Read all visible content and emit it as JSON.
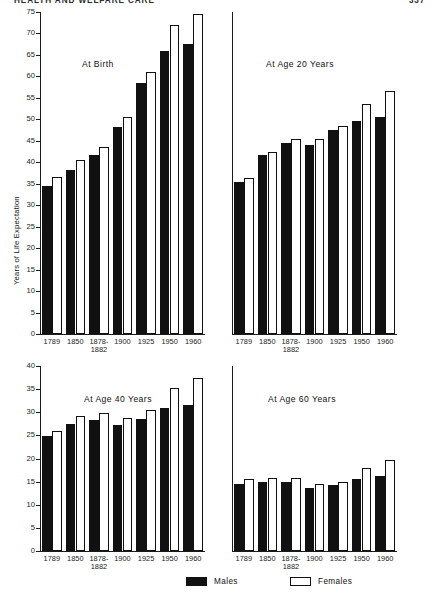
{
  "running_head": {
    "title": "HEALTH AND WELFARE CARE",
    "page_number": "337"
  },
  "figure": {
    "y_axis_caption": "Years of Life Expectation",
    "legend": [
      {
        "key": "males",
        "label": "Males",
        "style": "filled-black"
      },
      {
        "key": "females",
        "label": "Females",
        "style": "open-white"
      }
    ],
    "legend_colors": {
      "males": "#111111",
      "females": "#ffffff",
      "outline": "#111111"
    }
  },
  "chart_data": [
    {
      "type": "bar",
      "title": "At Birth",
      "panel": "top-left",
      "xlabel": "",
      "ylabel": "Years of Life Expectation",
      "categories": [
        "1789",
        "1850",
        "1878-1882",
        "1900",
        "1925",
        "1950",
        "1960"
      ],
      "category_lines": [
        [
          "1789"
        ],
        [
          "1850"
        ],
        [
          "1878-",
          "1882"
        ],
        [
          "1900"
        ],
        [
          "1925"
        ],
        [
          "1950"
        ],
        [
          "1960"
        ]
      ],
      "series": [
        {
          "name": "Males",
          "values": [
            34.5,
            38.3,
            41.7,
            48.2,
            58.5,
            66.0,
            67.5
          ]
        },
        {
          "name": "Females",
          "values": [
            36.5,
            40.5,
            43.5,
            50.5,
            61.0,
            72.0,
            74.5
          ]
        }
      ],
      "ylim": [
        0,
        75
      ],
      "yticks": [
        0,
        5,
        10,
        15,
        20,
        25,
        30,
        35,
        40,
        45,
        50,
        55,
        60,
        65,
        70,
        75
      ],
      "ytick_labels": [
        "0",
        "5",
        "10",
        "15",
        "20",
        "25",
        "30",
        "35",
        "40",
        "45",
        "50",
        "55",
        "60",
        "65",
        "70",
        "75"
      ],
      "grid": false,
      "legend_position": "below-figure"
    },
    {
      "type": "bar",
      "title": "At Age 20 Years",
      "panel": "top-right",
      "xlabel": "",
      "ylabel": "",
      "categories": [
        "1789",
        "1850",
        "1878-1882",
        "1900",
        "1925",
        "1950",
        "1960"
      ],
      "category_lines": [
        [
          "1789"
        ],
        [
          "1850"
        ],
        [
          "1878-",
          "1882"
        ],
        [
          "1900"
        ],
        [
          "1925"
        ],
        [
          "1950"
        ],
        [
          "1960"
        ]
      ],
      "series": [
        {
          "name": "Males",
          "values": [
            35.3,
            41.8,
            44.5,
            44.0,
            47.5,
            49.5,
            50.5
          ]
        },
        {
          "name": "Females",
          "values": [
            36.3,
            42.5,
            45.5,
            45.5,
            48.5,
            53.5,
            56.5
          ]
        }
      ],
      "ylim": [
        0,
        75
      ],
      "yticks": [],
      "ytick_labels": [],
      "grid": false,
      "shares_y_axis_with": "At Birth"
    },
    {
      "type": "bar",
      "title": "At Age 40 Years",
      "panel": "bottom-left",
      "xlabel": "",
      "ylabel": "",
      "categories": [
        "1789",
        "1850",
        "1878-1882",
        "1900",
        "1925",
        "1950",
        "1960"
      ],
      "category_lines": [
        [
          "1789"
        ],
        [
          "1850"
        ],
        [
          "1878-",
          "1882"
        ],
        [
          "1900"
        ],
        [
          "1925"
        ],
        [
          "1950"
        ],
        [
          "1960"
        ]
      ],
      "series": [
        {
          "name": "Males",
          "values": [
            24.9,
            27.4,
            28.3,
            27.2,
            28.6,
            31.0,
            31.6
          ]
        },
        {
          "name": "Females",
          "values": [
            25.9,
            29.2,
            29.9,
            28.7,
            30.4,
            35.3,
            37.5
          ]
        }
      ],
      "ylim": [
        0,
        40
      ],
      "yticks": [
        0,
        5,
        10,
        15,
        20,
        25,
        30,
        35,
        40
      ],
      "ytick_labels": [
        "0",
        "5",
        "10",
        "15",
        "20",
        "25",
        "30",
        "35",
        "40"
      ],
      "grid": false
    },
    {
      "type": "bar",
      "title": "At Age 60 Years",
      "panel": "bottom-right",
      "xlabel": "",
      "ylabel": "",
      "categories": [
        "1789",
        "1850",
        "1878-1882",
        "1900",
        "1925",
        "1950",
        "1960"
      ],
      "category_lines": [
        [
          "1789"
        ],
        [
          "1850"
        ],
        [
          "1878-",
          "1882"
        ],
        [
          "1900"
        ],
        [
          "1925"
        ],
        [
          "1950"
        ],
        [
          "1960"
        ]
      ],
      "series": [
        {
          "name": "Males",
          "values": [
            14.5,
            14.9,
            14.9,
            13.7,
            14.2,
            15.5,
            16.3
          ]
        },
        {
          "name": "Females",
          "values": [
            15.5,
            15.8,
            15.7,
            14.5,
            14.9,
            18.0,
            19.6
          ]
        }
      ],
      "ylim": [
        0,
        40
      ],
      "yticks": [],
      "ytick_labels": [],
      "grid": false,
      "shares_y_axis_with": "At Age 40 Years"
    }
  ]
}
